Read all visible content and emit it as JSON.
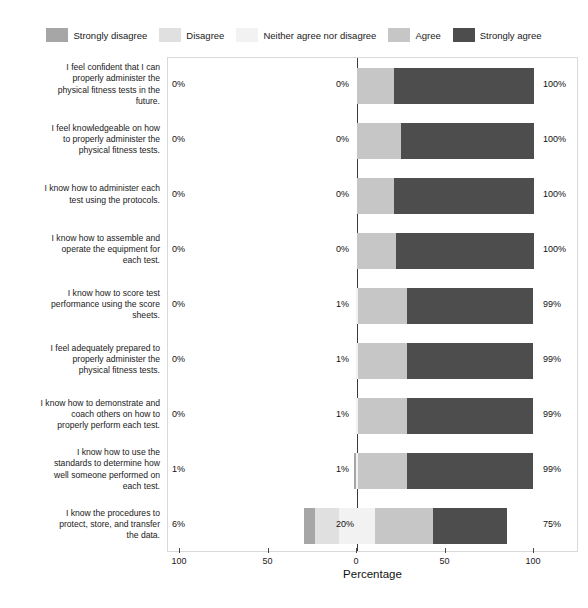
{
  "chart_data": {
    "type": "bar",
    "subtype": "diverging-stacked-likert",
    "title": "",
    "xlabel": "Percentage",
    "ylabel": "",
    "xlim": [
      -100,
      100
    ],
    "xticks": [
      100,
      50,
      0,
      50,
      100
    ],
    "xtick_labels": [
      "100",
      "50",
      "0",
      "50",
      "100"
    ],
    "grid": false,
    "legend_position": "top-center",
    "zero_reference": 0,
    "legend": [
      {
        "label": "Strongly disagree",
        "color": "#a6a6a6"
      },
      {
        "label": "Disagree",
        "color": "#e0e0e0"
      },
      {
        "label": "Neither agree nor disagree",
        "color": "#f2f2f2"
      },
      {
        "label": "Agree",
        "color": "#c6c6c6"
      },
      {
        "label": "Strongly agree",
        "color": "#4d4d4d"
      }
    ],
    "categories": [
      "I feel confident that I can properly administer the physical fitness tests in the future.",
      "I feel knowledgeable on how to properly administer the physical fitness tests.",
      "I know how to administer each test using the protocols.",
      "I know how to assemble and operate the equipment for each test.",
      "I know how to score test performance using the score sheets.",
      "I feel adequately prepared to properly administer the physical fitness tests.",
      "I know how to demonstrate and coach others on how to properly perform each test.",
      "I know how to use the standards to determine how well someone performed on each test.",
      "I know the procedures to protect, store, and transfer the data."
    ],
    "series": [
      {
        "name": "Strongly disagree",
        "values": [
          0,
          0,
          0,
          0,
          0,
          0,
          0,
          1,
          6
        ]
      },
      {
        "name": "Disagree",
        "values": [
          0,
          0,
          0,
          0,
          0,
          0,
          0,
          0,
          14
        ]
      },
      {
        "name": "Neither agree nor disagree",
        "values": [
          0,
          0,
          0,
          0,
          1,
          1,
          1,
          1,
          20
        ]
      },
      {
        "name": "Agree",
        "values": [
          21,
          25,
          21,
          22,
          28,
          28,
          28,
          33,
          33
        ]
      },
      {
        "name": "Strongly agree",
        "values": [
          79,
          75,
          79,
          78,
          71,
          71,
          71,
          66,
          42
        ]
      }
    ],
    "rows": [
      {
        "label": "I feel confident that I can properly administer the physical fitness tests in the future.",
        "label_lines": [
          "I feel confident that I can",
          "properly administer the",
          "physical fitness tests in the",
          "future."
        ],
        "strongly_disagree": 0,
        "disagree": 0,
        "neither": 0,
        "agree": 21,
        "strongly_agree": 79,
        "left_label": "0%",
        "mid_label": "0%",
        "right_label": "100%"
      },
      {
        "label": "I feel knowledgeable on how to properly administer the physical fitness tests.",
        "label_lines": [
          "I feel knowledgeable on how",
          "to properly administer the",
          "physical fitness tests."
        ],
        "strongly_disagree": 0,
        "disagree": 0,
        "neither": 0,
        "agree": 25,
        "strongly_agree": 75,
        "left_label": "0%",
        "mid_label": "0%",
        "right_label": "100%"
      },
      {
        "label": "I know how to administer each test using the protocols.",
        "label_lines": [
          "I know how to administer each",
          "test using the protocols."
        ],
        "strongly_disagree": 0,
        "disagree": 0,
        "neither": 0,
        "agree": 21,
        "strongly_agree": 79,
        "left_label": "0%",
        "mid_label": "0%",
        "right_label": "100%"
      },
      {
        "label": "I know how to assemble and operate the equipment for each test.",
        "label_lines": [
          "I know how to assemble and",
          "operate the equipment for",
          "each test."
        ],
        "strongly_disagree": 0,
        "disagree": 0,
        "neither": 0,
        "agree": 22,
        "strongly_agree": 78,
        "left_label": "0%",
        "mid_label": "0%",
        "right_label": "100%"
      },
      {
        "label": "I know how to score test performance using the score sheets.",
        "label_lines": [
          "I know how to score test",
          "performance using the score",
          "sheets."
        ],
        "strongly_disagree": 0,
        "disagree": 0,
        "neither": 1,
        "agree": 28,
        "strongly_agree": 71,
        "left_label": "0%",
        "mid_label": "1%",
        "right_label": "99%"
      },
      {
        "label": "I feel adequately prepared to properly administer the physical fitness tests.",
        "label_lines": [
          "I feel adequately prepared to",
          "properly administer the",
          "physical fitness tests."
        ],
        "strongly_disagree": 0,
        "disagree": 0,
        "neither": 1,
        "agree": 28,
        "strongly_agree": 71,
        "left_label": "0%",
        "mid_label": "1%",
        "right_label": "99%"
      },
      {
        "label": "I know how to demonstrate and coach others on how to properly perform each test.",
        "label_lines": [
          "I know how to demonstrate and",
          "coach others on how to",
          "properly perform each test."
        ],
        "strongly_disagree": 0,
        "disagree": 0,
        "neither": 1,
        "agree": 28,
        "strongly_agree": 71,
        "left_label": "0%",
        "mid_label": "1%",
        "right_label": "99%"
      },
      {
        "label": "I know how to use the standards to determine how well someone performed on each test.",
        "label_lines": [
          "I know how to use the",
          "standards to determine how",
          "well someone performed on",
          "each test."
        ],
        "strongly_disagree": 1,
        "disagree": 0,
        "neither": 1,
        "agree": 28,
        "strongly_agree": 71,
        "left_label": "1%",
        "mid_label": "1%",
        "right_label": "99%"
      },
      {
        "label": "I know the procedures to protect, store, and transfer the data.",
        "label_lines": [
          "I know the procedures to",
          "protect, store, and transfer",
          "the data."
        ],
        "strongly_disagree": 6,
        "disagree": 14,
        "neither": 20,
        "agree": 33,
        "strongly_agree": 42,
        "left_label": "6%",
        "mid_label": "20%",
        "right_label": "75%"
      }
    ]
  }
}
